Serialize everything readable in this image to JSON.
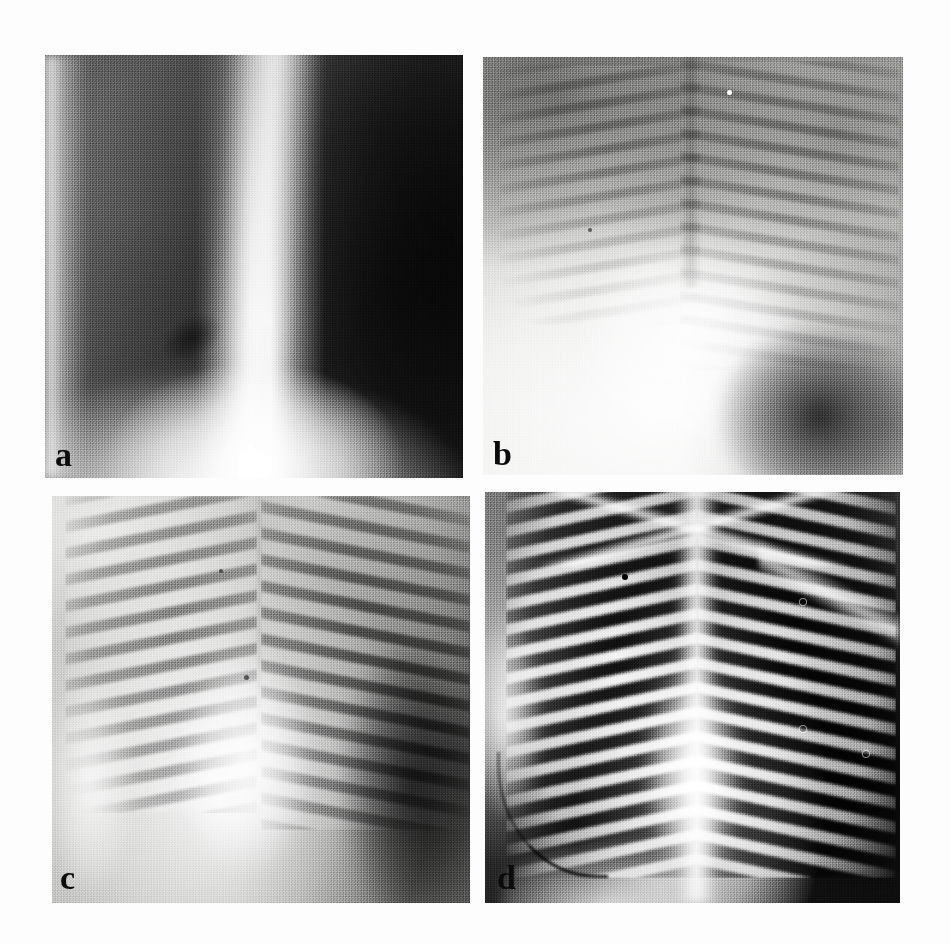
{
  "figure": {
    "type": "medical-radiograph-panel-figure",
    "layout": "2x2 grid",
    "background_color": "#fdfdfd",
    "panel_count": 4
  },
  "panels": [
    {
      "label": "a",
      "modality": "chest radiograph",
      "position": "top-left",
      "appearance": "very dark / underexposed film with a broad bright vertical mediastinal stripe running down the centre and a bright diaphragm at the lower edge",
      "dominant_color": "#3c3c3c",
      "highlight_color": "#ffffff"
    },
    {
      "label": "b",
      "modality": "chest radiograph",
      "position": "top-right",
      "appearance": "bright washed-out / overexposed film, faint rib shadows, dark apices and a dark lower-right corner",
      "dominant_color": "#d8d8d6",
      "highlight_color": "#ffffff"
    },
    {
      "label": "c",
      "modality": "chest radiograph",
      "position": "bottom-left",
      "appearance": "mid-grey film with prominent bilateral rib arcs, bright central cardiac silhouette and a darker right lung field",
      "dominant_color": "#bdbdbb",
      "highlight_color": "#f2f2f0"
    },
    {
      "label": "d",
      "modality": "chest radiograph",
      "position": "bottom-right",
      "appearance": "high-contrast film, near-black lung fields with bright white rib, clavicle and spine outlines and a bright central mediastinum",
      "dominant_color": "#2a2a2a",
      "highlight_color": "#ffffff"
    }
  ],
  "labels": {
    "a": "a",
    "b": "b",
    "c": "c",
    "d": "d"
  }
}
